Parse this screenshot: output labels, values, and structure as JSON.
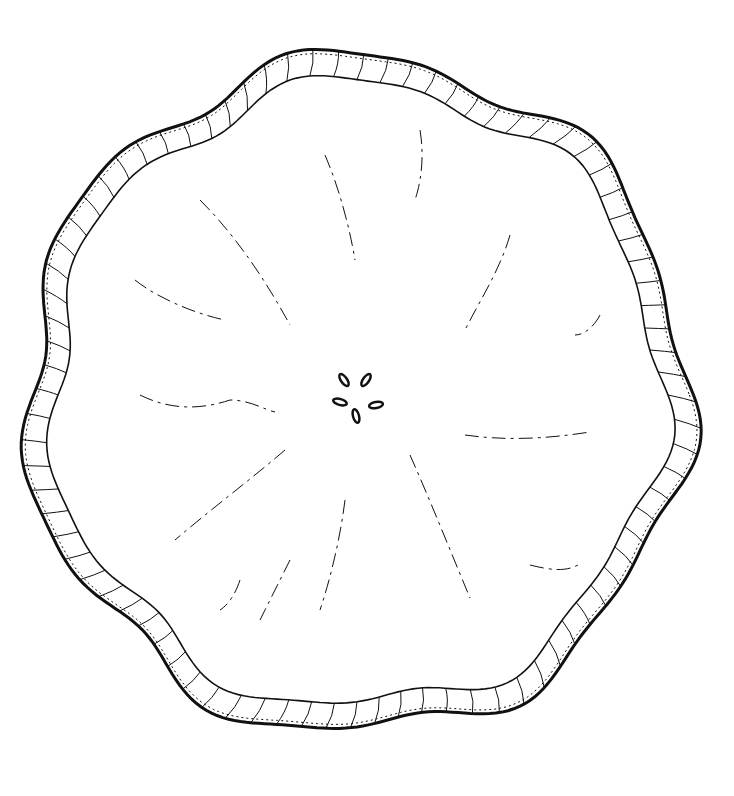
{
  "illustration": {
    "subject": "fruit slice cross-section line drawing",
    "width": 734,
    "height": 796,
    "background": "#ffffff",
    "ink": "#111111",
    "center": [
      357,
      395
    ],
    "outer_radius": 330,
    "inner_radius": 305,
    "rind_wobble": 0.035,
    "rind_ticks": 84,
    "seeds": [
      {
        "cx": 344,
        "cy": 380,
        "rx": 3,
        "ry": 7,
        "rot": -35
      },
      {
        "cx": 366,
        "cy": 380,
        "rx": 3,
        "ry": 7,
        "rot": 35
      },
      {
        "cx": 340,
        "cy": 402,
        "rx": 3,
        "ry": 7,
        "rot": -75
      },
      {
        "cx": 376,
        "cy": 405,
        "rx": 3,
        "ry": 7,
        "rot": 80
      },
      {
        "cx": 356,
        "cy": 416,
        "rx": 3,
        "ry": 7,
        "rot": -15
      }
    ],
    "segment_lines": [
      "M325,155 C340,190 350,230 355,260",
      "M200,200 C230,230 260,270 290,325",
      "M420,130 C425,160 420,185 415,200",
      "M510,235 C500,270 480,300 465,330",
      "M135,280 C160,300 200,315 225,320",
      "M140,395 C170,410 200,410 230,400 C250,400 265,410 275,412",
      "M465,435 C500,440 540,440 590,432",
      "M600,315 C595,325 585,335 575,335",
      "M285,450 C250,480 210,510 175,540",
      "M345,500 C340,540 330,580 320,610",
      "M410,455 C430,500 450,550 470,598",
      "M530,565 C550,570 565,572 578,565",
      "M240,580 C235,595 228,605 220,610",
      "M290,560 C280,580 270,600 260,620"
    ]
  }
}
